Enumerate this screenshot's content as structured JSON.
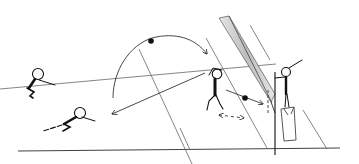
{
  "diagram": {
    "type": "volleyball-drill-illustration",
    "colors": {
      "background": "#ffffff",
      "line": "#333333",
      "thin_line": "#555555",
      "net_band": "#bdbdbd",
      "ink": "#111111"
    },
    "elements": [
      {
        "name": "ground-line"
      },
      {
        "name": "court-lines"
      },
      {
        "name": "net-band"
      },
      {
        "name": "net-post"
      },
      {
        "name": "ball-arc-arrow"
      },
      {
        "name": "pass-arrow"
      },
      {
        "name": "attack-arrow"
      },
      {
        "name": "movement-double-arrow"
      },
      {
        "name": "platform-box"
      },
      {
        "name": "player-squat"
      },
      {
        "name": "player-dive"
      },
      {
        "name": "player-blocker-center"
      },
      {
        "name": "player-on-box"
      }
    ]
  }
}
